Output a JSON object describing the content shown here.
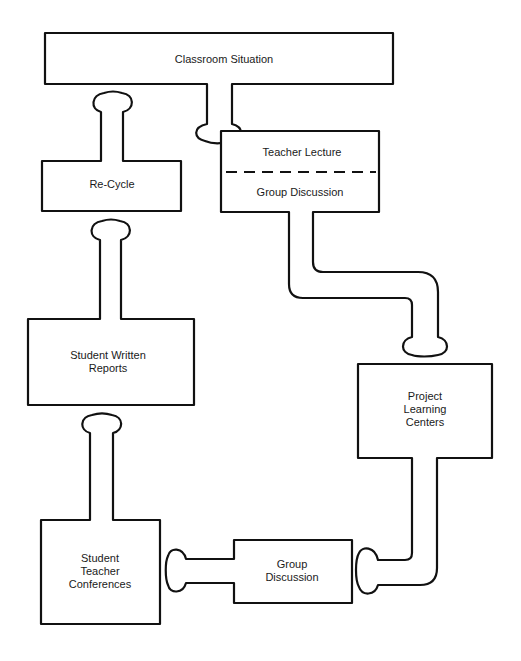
{
  "diagram": {
    "nodes": [
      {
        "id": "classroom",
        "label": "Classroom Situation"
      },
      {
        "id": "teacher_lecture",
        "label": "Teacher Lecture"
      },
      {
        "id": "group_discussion_1",
        "label": "Group Discussion"
      },
      {
        "id": "recycle",
        "label": "Re-Cycle"
      },
      {
        "id": "written_reports",
        "label": "Student Written\nReports",
        "lines": [
          "Student Written",
          "Reports"
        ]
      },
      {
        "id": "project_centers",
        "label": "Project\nLearning\nCenters",
        "lines": [
          "Project",
          "Learning",
          "Centers"
        ]
      },
      {
        "id": "group_discussion_2",
        "label": "Group\nDiscussion",
        "lines": [
          "Group",
          "Discussion"
        ]
      },
      {
        "id": "conferences",
        "label": "Student\nTeacher\nConferences",
        "lines": [
          "Student",
          "Teacher",
          "Conferences"
        ]
      }
    ],
    "edges": [
      {
        "from": "classroom",
        "to": "teacher_lecture"
      },
      {
        "from": "group_discussion_1",
        "to": "project_centers"
      },
      {
        "from": "project_centers",
        "to": "group_discussion_2"
      },
      {
        "from": "group_discussion_2",
        "to": "conferences"
      },
      {
        "from": "conferences",
        "to": "written_reports"
      },
      {
        "from": "written_reports",
        "to": "recycle"
      },
      {
        "from": "recycle",
        "to": "classroom"
      }
    ],
    "colors": {
      "stroke": "#111111",
      "fill": "#ffffff"
    }
  }
}
